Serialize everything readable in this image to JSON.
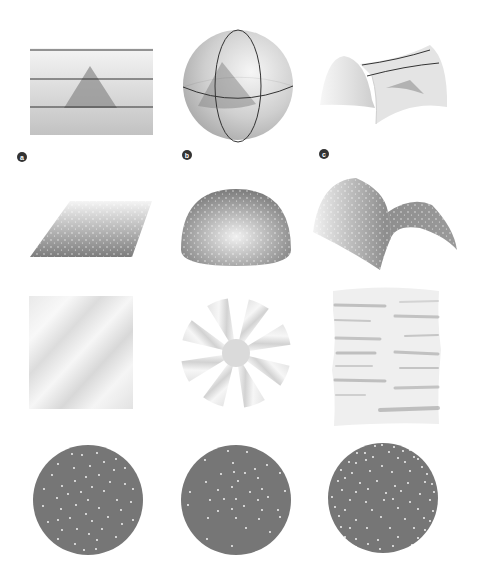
{
  "figure": {
    "colors": {
      "background": "#ffffff",
      "surface_light": "#f2f2f2",
      "surface_mid": "#c8c8c8",
      "surface_dark": "#7a7a7a",
      "triangle": "#8f8f8f",
      "lines": "#333333",
      "label_fill": "#333333",
      "label_text": "#ffffff",
      "disk": "#767676",
      "dots": "#ffffff"
    },
    "panel_labels": [
      "a",
      "b",
      "c"
    ],
    "columns": [
      {
        "label": "a",
        "geometry": "flat (zero curvature)"
      },
      {
        "label": "b",
        "geometry": "spherical (positive curvature)"
      },
      {
        "label": "c",
        "geometry": "hyperbolic (negative curvature)"
      }
    ],
    "rows": [
      {
        "name": "triangles-and-lines",
        "items": [
          "flat plane with parallel lines and triangle",
          "sphere with great circles and triangle",
          "saddle surface with diverging lines and triangle"
        ]
      },
      {
        "name": "dotted-surfaces",
        "items": [
          "flat parallelogram sheet",
          "hemisphere dome",
          "saddle sheet"
        ]
      },
      {
        "name": "flattened-sheets",
        "items": [
          "flat square",
          "eight-wedge cut disk",
          "ruffled sheet"
        ]
      },
      {
        "name": "dot-distributions",
        "items": [
          "uniform dots",
          "sparse dots",
          "dense dots near edge"
        ]
      }
    ]
  }
}
